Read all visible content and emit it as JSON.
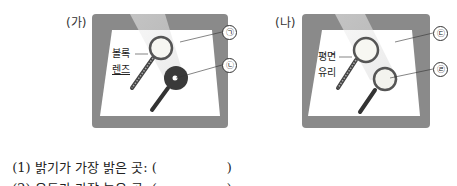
{
  "panels": [
    {
      "label": "(가)",
      "lens_label_line1": "볼록",
      "lens_label_line2": "렌즈",
      "markers": [
        "㉠",
        "㉡"
      ]
    },
    {
      "label": "(나)",
      "lens_label_line1": "평면",
      "lens_label_line2": "유리",
      "markers": [
        "㉢",
        "㉣"
      ]
    }
  ],
  "questions": [
    {
      "text": "(1) 밝기가 가장 밝은 곳: (",
      "close": ")"
    },
    {
      "text": "(2) 온도가 가장 높은 곳: (",
      "close": ")"
    }
  ],
  "colors": {
    "frame": "#8a8a8a",
    "paper": "#ffffff",
    "light_beam": "#e8e8e8",
    "dark_spot": "#3a3a3a"
  }
}
